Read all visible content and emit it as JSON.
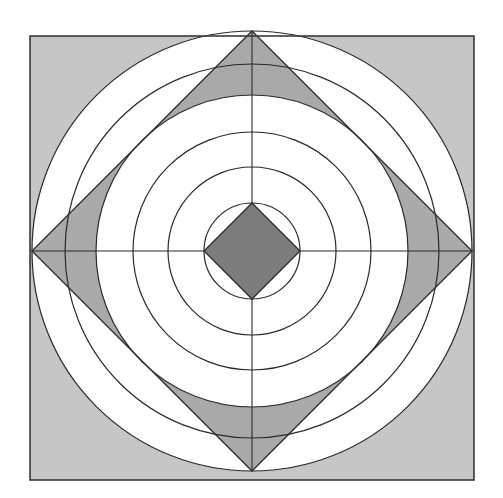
{
  "canvas": {
    "width": 503,
    "height": 498,
    "background": "#ffffff"
  },
  "diagram": {
    "center": {
      "x": 252,
      "y": 251
    },
    "square": {
      "x": 30,
      "y": 36,
      "size": 444,
      "fill": "#c6c6c6",
      "stroke": "#3a3a3a",
      "stroke_width": 1.6
    },
    "outer_circle": {
      "r": 220,
      "fill": "#ffffff",
      "stroke": "#2a2a2a",
      "stroke_width": 1.4
    },
    "large_diamond": {
      "half_diagonal": 220,
      "fill": "#a9a9a9",
      "stroke": "#2a2a2a",
      "stroke_width": 1.3
    },
    "inscribed_circle": {
      "r": 156,
      "fill": "#ffffff"
    },
    "concentric_circles": [
      {
        "r": 220
      },
      {
        "r": 187
      },
      {
        "r": 156
      },
      {
        "r": 119
      },
      {
        "r": 84
      },
      {
        "r": 48
      }
    ],
    "circle_stroke": "#2a2a2a",
    "circle_stroke_width": 1.2,
    "small_diamond": {
      "half_diagonal": 48,
      "fill": "#7c7c7c",
      "stroke": "#2a2a2a",
      "stroke_width": 1.3
    },
    "axes": {
      "stroke": "#2a2a2a",
      "stroke_width": 1.1
    }
  }
}
